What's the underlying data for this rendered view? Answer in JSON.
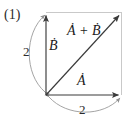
{
  "figure": {
    "equation_number": "(1)",
    "canvas": {
      "width": 136,
      "height": 121,
      "background": "#ffffff"
    },
    "colors": {
      "vector_stroke": "#3a3a3a",
      "frame_stroke": "#c9c9c9",
      "dimension_arc_stroke": "#9a9a9a",
      "text": "#1a1a1a"
    },
    "frame": {
      "name": "parallelogram-square-outline",
      "origin": {
        "x": 46,
        "y": 95
      },
      "top_left": {
        "x": 46,
        "y": 12
      },
      "top_right": {
        "x": 122,
        "y": 12
      },
      "bottom_right": {
        "x": 122,
        "y": 95
      }
    },
    "vectors": [
      {
        "id": "vector-b",
        "label": "Ḃ",
        "from": {
          "x": 46,
          "y": 95
        },
        "to": {
          "x": 46,
          "y": 12
        },
        "orientation": "vertical"
      },
      {
        "id": "vector-a",
        "label": "Ȧ",
        "from": {
          "x": 46,
          "y": 95
        },
        "to": {
          "x": 122,
          "y": 95
        },
        "orientation": "horizontal"
      },
      {
        "id": "vector-sum",
        "label": "Ȧ + Ḃ",
        "from": {
          "x": 46,
          "y": 95
        },
        "to": {
          "x": 122,
          "y": 12
        },
        "orientation": "diagonal"
      }
    ],
    "dimensions": [
      {
        "id": "dimension-left",
        "label": "2",
        "side": "left",
        "spans": "vector-b"
      },
      {
        "id": "dimension-bottom",
        "label": "2",
        "side": "bottom",
        "spans": "vector-a"
      }
    ]
  }
}
